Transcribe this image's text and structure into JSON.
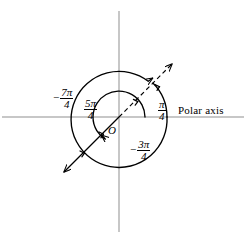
{
  "figure": {
    "kind": "polar-coordinate-diagram",
    "background_color": "#ffffff",
    "stroke_color": "#000000",
    "axis_color": "#8a8a8a"
  },
  "axes": {
    "polar_axis_label": "Polar axis",
    "origin_label": "O",
    "horizontal_axis_name": "polar-axis-line",
    "vertical_axis_name": "vertical-axis-line"
  },
  "angles": [
    {
      "id": "pi-over-4",
      "sign": "",
      "numerator": "π",
      "denominator": "4",
      "display": "π/4",
      "value_radians": 0.7853981634,
      "direction_degrees": 45,
      "sweep": "counterclockwise",
      "terminal_ray_style": "dashed"
    },
    {
      "id": "five-pi-over-4",
      "sign": "",
      "numerator": "5π",
      "denominator": "4",
      "display": "5π/4",
      "value_radians": 3.926990817,
      "direction_degrees": 225,
      "sweep": "counterclockwise",
      "terminal_ray_style": "solid"
    },
    {
      "id": "negative-three-pi-over-4",
      "sign": "−",
      "numerator": "3π",
      "denominator": "4",
      "display": "−3π/4",
      "value_radians": -2.35619449,
      "direction_degrees": 225,
      "sweep": "clockwise",
      "terminal_ray_style": "solid"
    },
    {
      "id": "negative-seven-pi-over-4",
      "sign": "−",
      "numerator": "7π",
      "denominator": "4",
      "display": "−7π/4",
      "value_radians": -5.497787144,
      "direction_degrees": 45,
      "sweep": "clockwise",
      "terminal_ray_style": "dashed"
    }
  ],
  "labels": {
    "neg_seven_pi_over_4": {
      "minus": "−",
      "numerator": "7π",
      "denominator": "4"
    },
    "five_pi_over_4": {
      "minus": "",
      "numerator": "5π",
      "denominator": "4"
    },
    "pi_over_4": {
      "minus": "",
      "numerator": "π",
      "denominator": "4"
    },
    "neg_three_pi_over_4": {
      "minus": "−",
      "numerator": "3π",
      "denominator": "4"
    },
    "origin": "O",
    "polar_axis": "Polar axis"
  },
  "geometry": {
    "origin_x": 119,
    "origin_y": 117,
    "inner_arc_radius": 26,
    "outer_arc_radius": 48,
    "ray_length": 72
  }
}
